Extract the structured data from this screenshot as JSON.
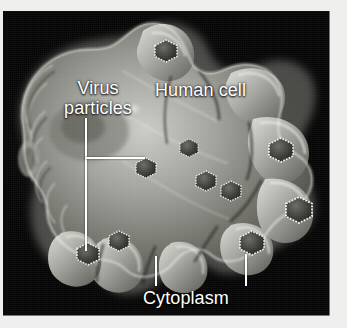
{
  "figure": {
    "kind": "electron-micrograph",
    "background_color": "#050505",
    "border_color": "#efefed",
    "label_color": "#ffffff",
    "cell_tone_light": "#d8d8d4",
    "cell_tone_mid": "#8d8d8a",
    "cell_tone_dark": "#3a3a38"
  },
  "labels": {
    "virus_line1": "Virus",
    "virus_line2": "particles",
    "human_cell": "Human cell",
    "cytoplasm": "Cytoplasm"
  },
  "leaders": [
    {
      "name": "virus-vertical",
      "orientation": "vertical"
    },
    {
      "name": "virus-horizontal",
      "orientation": "horizontal"
    },
    {
      "name": "cytoplasm-left",
      "orientation": "vertical"
    },
    {
      "name": "cytoplasm-right",
      "orientation": "vertical"
    }
  ],
  "virus_particles": [
    {
      "id": 1,
      "cx": 163,
      "cy": 40,
      "r": 11
    },
    {
      "id": 2,
      "cx": 143,
      "cy": 157,
      "r": 10
    },
    {
      "id": 3,
      "cx": 186,
      "cy": 137,
      "r": 9
    },
    {
      "id": 4,
      "cx": 203,
      "cy": 170,
      "r": 10
    },
    {
      "id": 5,
      "cx": 228,
      "cy": 180,
      "r": 10
    },
    {
      "id": 6,
      "cx": 278,
      "cy": 139,
      "r": 12
    },
    {
      "id": 7,
      "cx": 296,
      "cy": 199,
      "r": 13
    },
    {
      "id": 8,
      "cx": 249,
      "cy": 232,
      "r": 12
    },
    {
      "id": 9,
      "cx": 116,
      "cy": 230,
      "r": 10
    },
    {
      "id": 10,
      "cx": 85,
      "cy": 243,
      "r": 11
    }
  ]
}
